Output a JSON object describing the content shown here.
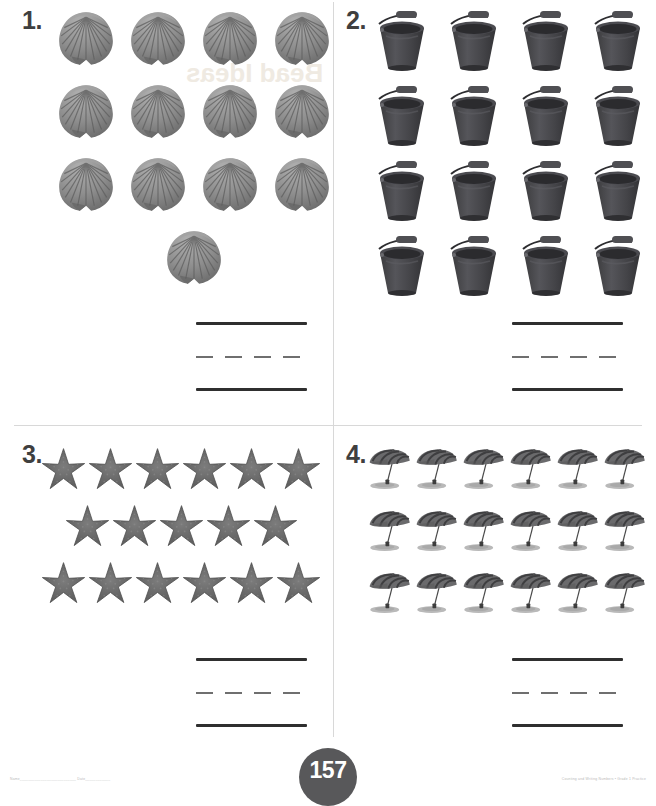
{
  "worksheet": {
    "page_number": "157",
    "footer_left_note": "Name___________________________ Date____________",
    "footer_right_note": "Counting and Writing Numbers  •  Grade 1 Practice",
    "bleed_text": "Bead Ideas"
  },
  "questions": [
    {
      "number": "1.",
      "object": "scallop-shell",
      "object_label": "shell",
      "rows": [
        4,
        4,
        4,
        1
      ],
      "total": 13,
      "answer_lines": [
        "solid",
        "dashed",
        "solid"
      ]
    },
    {
      "number": "2.",
      "object": "bucket",
      "object_label": "bucket",
      "rows": [
        4,
        4,
        4,
        4
      ],
      "total": 16,
      "answer_lines": [
        "solid",
        "dashed",
        "solid"
      ]
    },
    {
      "number": "3.",
      "object": "starfish",
      "object_label": "starfish",
      "rows": [
        6,
        5,
        6
      ],
      "total": 17,
      "answer_lines": [
        "solid",
        "dashed",
        "solid"
      ]
    },
    {
      "number": "4.",
      "object": "beach-umbrella",
      "object_label": "umbrella",
      "rows": [
        6,
        6,
        6
      ],
      "total": 18,
      "answer_lines": [
        "solid",
        "dashed",
        "solid"
      ]
    }
  ],
  "colors": {
    "ink": "#3a3a3a",
    "line": "#2f2f2f",
    "divider": "#d8d8d8",
    "badge_bg": "#58585a",
    "shell": "#8d8d8d",
    "bucket": "#4a4a4c",
    "starfish": "#6d6d6d",
    "umbrella": "#5a5a5c",
    "sand": "#b9b9b9"
  }
}
